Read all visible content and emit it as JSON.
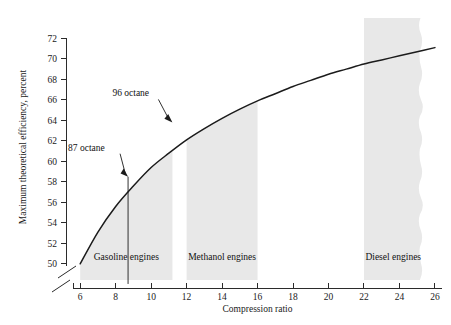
{
  "chart_data": {
    "type": "line",
    "title": "",
    "xlabel": "Compression ratio",
    "ylabel": "Maximum theoretical efficiency, percent",
    "xlim": [
      5.2,
      26.4
    ],
    "ylim": [
      49.2,
      73.6
    ],
    "grid": false,
    "legend": "none",
    "axis_break": {
      "x": true,
      "y": true,
      "note": "broken axis near origin"
    },
    "xticks": [
      6,
      8,
      10,
      12,
      14,
      16,
      18,
      20,
      22,
      24,
      26
    ],
    "yticks": [
      50,
      52,
      54,
      56,
      58,
      60,
      62,
      64,
      66,
      68,
      70,
      72
    ],
    "xtick_labels": [
      "6",
      "8",
      "10",
      "12",
      "14",
      "16",
      "18",
      "20",
      "22",
      "24",
      "26"
    ],
    "ytick_labels": [
      "50",
      "52",
      "54",
      "56",
      "58",
      "60",
      "62",
      "64",
      "66",
      "68",
      "70",
      "72"
    ],
    "series": [
      {
        "name": "Maximum theoretical efficiency",
        "x": [
          6,
          7,
          8,
          9,
          10,
          11,
          12,
          13,
          14,
          15,
          16,
          17,
          18,
          19,
          20,
          21,
          22,
          23,
          24,
          25,
          26
        ],
        "y": [
          50.0,
          53.1,
          55.6,
          57.6,
          59.4,
          60.8,
          62.1,
          63.2,
          64.2,
          65.1,
          65.9,
          66.6,
          67.3,
          67.9,
          68.5,
          69.0,
          69.5,
          69.9,
          70.3,
          70.7,
          71.1
        ]
      }
    ],
    "regions": [
      {
        "label": "Gasoline engines",
        "x_start": 6.0,
        "x_end": 11.2,
        "color": "#e8e8e8",
        "edge": "straight"
      },
      {
        "label": "Methanol engines",
        "x_start": 12.0,
        "x_end": 16.0,
        "color": "#e8e8e8",
        "edge": "straight"
      },
      {
        "label": "Diesel engines",
        "x_start": 22.0,
        "x_end": 25.3,
        "color": "#e8e8e8",
        "edge": "wavy-right"
      }
    ],
    "annotations": [
      {
        "label": "87 octane",
        "point_x": 8.7,
        "point_y": 58.5,
        "has_vertical_line": true,
        "vertical_line_to_y": 49.4
      },
      {
        "label": "96 octane",
        "point_x": 11.2,
        "point_y": 63.8,
        "has_vertical_line": false
      }
    ],
    "colors": {
      "curve": "#1b1b1b",
      "axis": "#2b2b2b",
      "region_fill": "#e8e8e8",
      "background": "#ffffff",
      "text": "#1a1a1a"
    }
  },
  "axes": {
    "x_title": "Compression ratio",
    "y_title": "Maximum theoretical efficiency, percent"
  },
  "ticks": {
    "y": [
      "72",
      "70",
      "68",
      "66",
      "64",
      "62",
      "60",
      "58",
      "56",
      "54",
      "52",
      "50"
    ],
    "x": [
      "6",
      "8",
      "10",
      "12",
      "14",
      "16",
      "18",
      "20",
      "22",
      "24",
      "26"
    ]
  },
  "regions": {
    "gasoline": "Gasoline engines",
    "methanol": "Methanol engines",
    "diesel": "Diesel engines"
  },
  "annotations": {
    "octane_87": "87 octane",
    "octane_96": "96 octane"
  }
}
